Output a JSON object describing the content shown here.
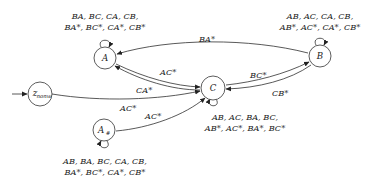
{
  "diagram": {
    "type": "state-machine",
    "nodes": [
      {
        "id": "A",
        "label": "A",
        "subscript": ""
      },
      {
        "id": "B",
        "label": "B",
        "subscript": ""
      },
      {
        "id": "C",
        "label": "C",
        "subscript": ""
      },
      {
        "id": "z_nonw",
        "label": "z",
        "subscript": "nonw"
      },
      {
        "id": "A_hash",
        "label": "A",
        "subscript": "#"
      }
    ],
    "self_loops": {
      "A": {
        "line1": "BA, BC, CA, CB,",
        "line2": "BA*, BC*, CA*, CB*"
      },
      "B": {
        "line1": "AB, AC, CA, CB,",
        "line2": "AB*, AC*, CA*, CB*"
      },
      "C": {
        "line1": "AB, AC, BA, BC,",
        "line2": "AB*, AC*, BA*, BC*"
      },
      "A_hash": {
        "line1": "AB, BA, BC, CA, CB,",
        "line2": "BA*, BC*, CA*, CB*"
      }
    },
    "edges": [
      {
        "from": "B",
        "to": "A",
        "label": "BA*"
      },
      {
        "from": "A",
        "to": "C",
        "label": "AC*"
      },
      {
        "from": "C",
        "to": "A",
        "label": "CA*"
      },
      {
        "from": "C",
        "to": "B",
        "label": "BC*"
      },
      {
        "from": "B",
        "to": "C",
        "label": "CB*"
      },
      {
        "from": "z_nonw",
        "to": "C",
        "label": "AC*"
      },
      {
        "from": "A_hash",
        "to": "C",
        "label": "AC*"
      }
    ],
    "initial_state": "z_nonw"
  }
}
